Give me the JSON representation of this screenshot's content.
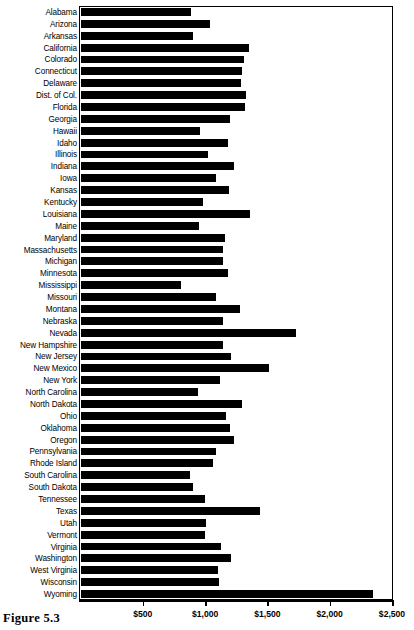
{
  "caption": "Figure 5.3",
  "chart_data": {
    "type": "bar",
    "orientation": "horizontal",
    "title": "",
    "subtitle": "",
    "xlabel": "",
    "ylabel": "",
    "xlim": [
      0,
      2500
    ],
    "ylim": null,
    "grid": false,
    "legend": null,
    "legend_position": "none",
    "bar_color": "#000000",
    "frame": true,
    "xticks": [
      {
        "value": 500,
        "label": "$500"
      },
      {
        "value": 1000,
        "label": "$1,000"
      },
      {
        "value": 1500,
        "label": "$1,500"
      },
      {
        "value": 2000,
        "label": "$2,000"
      },
      {
        "value": 2500,
        "label": "$2,500"
      }
    ],
    "categories": [
      "Alabama",
      "Arizona",
      "Arkansas",
      "California",
      "Colorado",
      "Connecticut",
      "Delaware",
      "Dist. of Col.",
      "Florida",
      "Georgia",
      "Hawaii",
      "Idaho",
      "Illinois",
      "Indiana",
      "Iowa",
      "Kansas",
      "Kentucky",
      "Louisiana",
      "Maine",
      "Maryland",
      "Massachusetts",
      "Michigan",
      "Minnesota",
      "Mississippi",
      "Missouri",
      "Montana",
      "Nebraska",
      "Nevada",
      "New Hampshire",
      "New Jersey",
      "New Mexico",
      "New York",
      "North Carolina",
      "North Dakota",
      "Ohio",
      "Oklahoma",
      "Oregon",
      "Pennsylvania",
      "Rhode Island",
      "South Carolina",
      "South Dakota",
      "Tennessee",
      "Texas",
      "Utah",
      "Vermont",
      "Virginia",
      "Washington",
      "West Virginia",
      "Wisconsin",
      "Wyoming"
    ],
    "values": [
      890,
      1040,
      900,
      1350,
      1310,
      1300,
      1290,
      1330,
      1320,
      1200,
      960,
      1180,
      1020,
      1230,
      1090,
      1190,
      980,
      1360,
      950,
      1160,
      1140,
      1140,
      1180,
      810,
      1090,
      1280,
      1140,
      1730,
      1140,
      1210,
      1510,
      1120,
      940,
      1300,
      1170,
      1200,
      1230,
      1090,
      1060,
      880,
      900,
      1000,
      1440,
      1010,
      1000,
      1130,
      1210,
      1100,
      1110,
      2350
    ]
  }
}
